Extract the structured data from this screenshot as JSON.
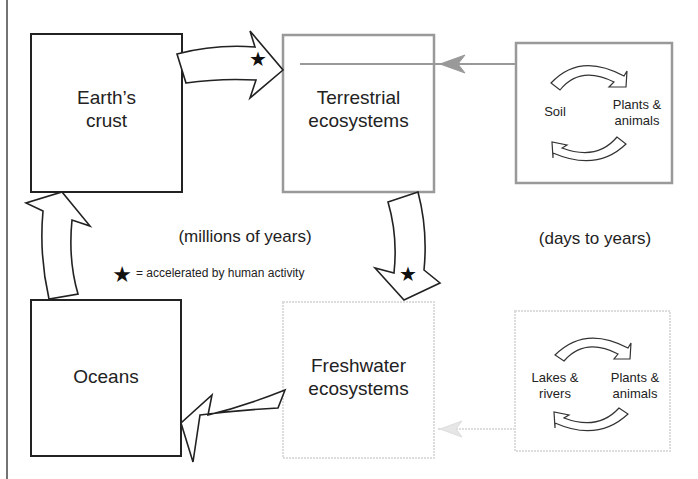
{
  "header": {
    "cutoff_text": "(partially visible heading text cut off at top)"
  },
  "colors": {
    "geological_stroke": "#222222",
    "terrestrial_stroke": "#999999",
    "freshwater_stroke": "#dddddd",
    "arrow_fill": "#ffffff",
    "arrow_stroke": "#222222",
    "star": "#111111"
  },
  "boxes": {
    "earths_crust": {
      "line1": "Earth’s",
      "line2": "crust"
    },
    "terrestrial": {
      "line1": "Terrestrial",
      "line2": "ecosystems"
    },
    "oceans": {
      "label": "Oceans"
    },
    "freshwater": {
      "line1": "Freshwater",
      "line2": "ecosystems"
    },
    "soil_cycle": {
      "left": "Soil",
      "right_line1": "Plants &",
      "right_line2": "animals"
    },
    "lake_cycle": {
      "left_line1": "Lakes &",
      "left_line2": "rivers",
      "right_line1": "Plants &",
      "right_line2": "animals"
    }
  },
  "annotations": {
    "geological_timescale": "(millions of years)",
    "biological_timescale": "(days to years)",
    "legend_star": "★",
    "legend_text": "= accelerated by human activity"
  }
}
